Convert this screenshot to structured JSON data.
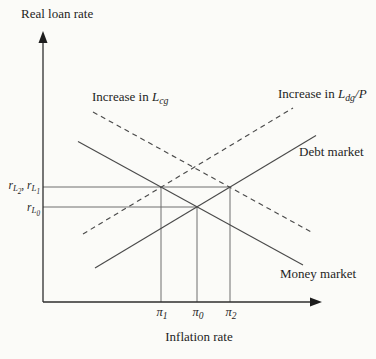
{
  "figure": {
    "background": "#fbfbf8",
    "ink_color": "#1e1e1e",
    "curve_color": "#4a4a4a",
    "reference_color": "#6e6e6e"
  },
  "axes": {
    "y_title": "Real loan rate",
    "x_title": "Inflation rate",
    "origin": {
      "x": 43,
      "y": 302
    },
    "y_top": 40,
    "x_right": 313
  },
  "chart_data": {
    "type": "line",
    "title": "",
    "xlabel": "Inflation rate",
    "ylabel": "Real loan rate",
    "grid": false,
    "curves": [
      {
        "name": "money-market",
        "style": "solid",
        "label": "Money market",
        "x1": 78,
        "y1": 141.5,
        "x2": 303,
        "y2": 265
      },
      {
        "name": "debt-market",
        "style": "solid",
        "label": "Debt market",
        "x1": 95,
        "y1": 268,
        "x2": 316,
        "y2": 135.5
      },
      {
        "name": "money-market-shifted",
        "style": "dashed",
        "label": "Increase in L_cg",
        "x1": 93,
        "y1": 112,
        "x2": 313,
        "y2": 233
      },
      {
        "name": "debt-market-shifted",
        "style": "dashed",
        "label": "Increase in L_dg/P",
        "x1": 83,
        "y1": 234,
        "x2": 293,
        "y2": 108
      }
    ],
    "reference_lines": {
      "horizontal": [
        {
          "name": "r-upper-line",
          "label": "r_L2, r_L1",
          "y": 187,
          "x_start": 43,
          "x_end": 230
        },
        {
          "name": "r-lower-line",
          "label": "r_L0",
          "y": 207,
          "x_start": 43,
          "x_end": 197
        }
      ],
      "vertical": [
        {
          "name": "pi1-line",
          "label": "pi_1",
          "x": 161,
          "y_top": 187,
          "y_bottom": 302
        },
        {
          "name": "pi0-line",
          "label": "pi_0",
          "x": 197,
          "y_top": 207,
          "y_bottom": 302
        },
        {
          "name": "pi2-line",
          "label": "pi_2",
          "x": 230,
          "y_top": 187,
          "y_bottom": 302
        }
      ]
    },
    "equilibria": [
      {
        "x": "pi_0",
        "y": "r_L0",
        "meaning": "money market intersects debt market"
      },
      {
        "x": "pi_1",
        "y": "r_L1",
        "meaning": "money market intersects shifted debt curve (increase in L_dg/P)"
      },
      {
        "x": "pi_2",
        "y": "r_L2",
        "meaning": "debt market intersects shifted money curve (increase in L_cg)"
      }
    ]
  },
  "labels": {
    "y_axis_title": "Real loan rate",
    "x_axis_title": "Inflation rate",
    "increase_lcg": {
      "prefix": "Increase in ",
      "symbol": "L",
      "sub": "cg",
      "suffix": ""
    },
    "increase_ldg": {
      "prefix": "Increase in ",
      "symbol": "L",
      "sub": "dg",
      "suffix": "/P"
    },
    "debt_market": "Debt market",
    "money_market": "Money market",
    "r_upper": {
      "a_base": "r",
      "a_sub": "L",
      "a_subsub": "2",
      "sep": ", ",
      "b_base": "r",
      "b_sub": "L",
      "b_subsub": "1"
    },
    "r_lower": {
      "base": "r",
      "sub": "L",
      "subsub": "0"
    },
    "pi_ticks": [
      {
        "base": "π",
        "sub": "1"
      },
      {
        "base": "π",
        "sub": "0"
      },
      {
        "base": "π",
        "sub": "2"
      }
    ]
  }
}
